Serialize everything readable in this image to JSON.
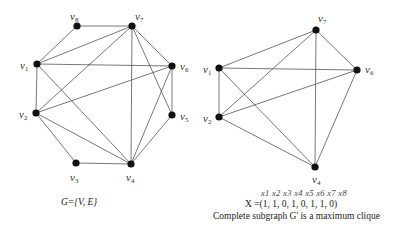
{
  "left_graph": {
    "caption": "G={V, E}",
    "nodes": [
      {
        "id": "v1",
        "label": "v",
        "sub": "1",
        "x": 37,
        "y": 64,
        "lx": 20,
        "ly": 69
      },
      {
        "id": "v2",
        "label": "v",
        "sub": "2",
        "x": 36,
        "y": 113,
        "lx": 19,
        "ly": 118
      },
      {
        "id": "v3",
        "label": "v",
        "sub": "3",
        "x": 76,
        "y": 163,
        "lx": 70,
        "ly": 181
      },
      {
        "id": "v4",
        "label": "v",
        "sub": "4",
        "x": 131,
        "y": 164,
        "lx": 126,
        "ly": 181
      },
      {
        "id": "v5",
        "label": "v",
        "sub": "5",
        "x": 172,
        "y": 115,
        "lx": 180,
        "ly": 120
      },
      {
        "id": "v6",
        "label": "v",
        "sub": "6",
        "x": 172,
        "y": 66,
        "lx": 180,
        "ly": 70
      },
      {
        "id": "v7",
        "label": "v",
        "sub": "7",
        "x": 132,
        "y": 26,
        "lx": 135,
        "ly": 20
      },
      {
        "id": "v8",
        "label": "v",
        "sub": "8",
        "x": 77,
        "y": 26,
        "lx": 70,
        "ly": 20
      }
    ],
    "edges": [
      [
        "v8",
        "v7"
      ],
      [
        "v8",
        "v1"
      ],
      [
        "v7",
        "v1"
      ],
      [
        "v7",
        "v2"
      ],
      [
        "v7",
        "v6"
      ],
      [
        "v7",
        "v4"
      ],
      [
        "v7",
        "v5"
      ],
      [
        "v1",
        "v6"
      ],
      [
        "v1",
        "v2"
      ],
      [
        "v1",
        "v4"
      ],
      [
        "v6",
        "v2"
      ],
      [
        "v6",
        "v5"
      ],
      [
        "v6",
        "v4"
      ],
      [
        "v2",
        "v3"
      ],
      [
        "v2",
        "v4"
      ],
      [
        "v3",
        "v4"
      ],
      [
        "v5",
        "v4"
      ]
    ]
  },
  "right_graph": {
    "nodes": [
      {
        "id": "v1",
        "label": "v",
        "sub": "1",
        "x": 219,
        "y": 68,
        "lx": 203,
        "ly": 73
      },
      {
        "id": "v2",
        "label": "v",
        "sub": "2",
        "x": 219,
        "y": 117,
        "lx": 203,
        "ly": 122
      },
      {
        "id": "v4",
        "label": "v",
        "sub": "4",
        "x": 315,
        "y": 167,
        "lx": 312,
        "ly": 183
      },
      {
        "id": "v6",
        "label": "v",
        "sub": "6",
        "x": 357,
        "y": 70,
        "lx": 365,
        "ly": 73
      },
      {
        "id": "v7",
        "label": "v",
        "sub": "7",
        "x": 316,
        "y": 30,
        "lx": 318,
        "ly": 22
      }
    ],
    "edges": [
      [
        "v1",
        "v2"
      ],
      [
        "v1",
        "v4"
      ],
      [
        "v1",
        "v6"
      ],
      [
        "v1",
        "v7"
      ],
      [
        "v2",
        "v4"
      ],
      [
        "v2",
        "v6"
      ],
      [
        "v2",
        "v7"
      ],
      [
        "v4",
        "v6"
      ],
      [
        "v4",
        "v7"
      ],
      [
        "v6",
        "v7"
      ]
    ]
  },
  "solution": {
    "x_header": "x1 x2 x3 x4 x5 x6 x7 x8",
    "x_vector": "X =(1, 1,  0, 1,  0, 1, 1,  0)",
    "description": "Complete subgraph G' is a maximum clique"
  }
}
